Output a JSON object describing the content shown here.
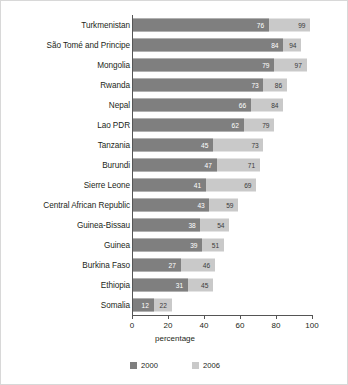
{
  "chart_data": {
    "type": "bar",
    "orientation": "horizontal",
    "title": "",
    "xlabel": "percentage",
    "ylabel": "",
    "xlim": [
      0,
      100
    ],
    "xticks": [
      0,
      20,
      40,
      60,
      80,
      100
    ],
    "grid": false,
    "legend_position": "bottom",
    "categories": [
      "Turkmenistan",
      "São Tomé and Principe",
      "Mongolia",
      "Rwanda",
      "Nepal",
      "Lao PDR",
      "Tanzania",
      "Burundi",
      "Sierre Leone",
      "Central African Republic",
      "Guinea-Bissau",
      "Guinea",
      "Burkina Faso",
      "Ethiopia",
      "Somalia"
    ],
    "series": [
      {
        "name": "2000",
        "color": "#7f7f7f",
        "values": [
          76,
          84,
          79,
          73,
          66,
          62,
          45,
          47,
          41,
          43,
          38,
          39,
          27,
          31,
          12
        ]
      },
      {
        "name": "2006",
        "color": "#c9c9c9",
        "values": [
          99,
          94,
          97,
          86,
          84,
          79,
          73,
          71,
          69,
          59,
          54,
          51,
          46,
          45,
          22
        ]
      }
    ]
  },
  "legend": {
    "items": [
      {
        "label": "2000",
        "color": "#7f7f7f"
      },
      {
        "label": "2006",
        "color": "#c9c9c9"
      }
    ]
  }
}
